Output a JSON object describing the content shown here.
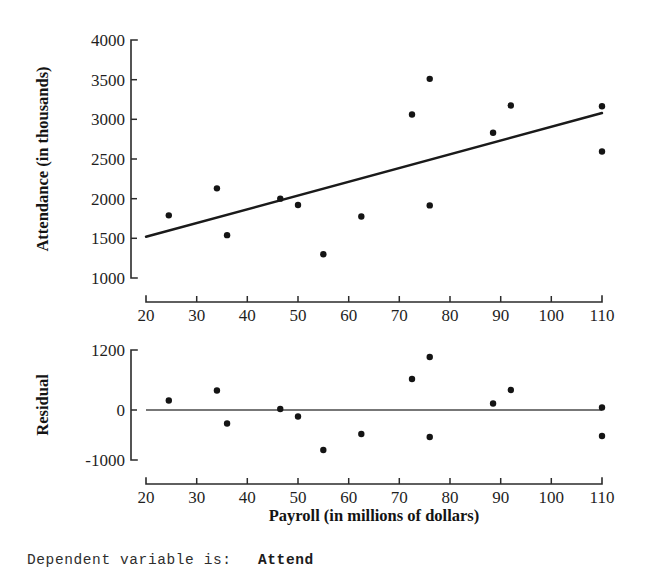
{
  "figure": {
    "regression_output": {
      "label": "Dependent variable is:",
      "value": "Attend"
    }
  },
  "chart_data": [
    {
      "type": "scatter",
      "title": "",
      "xlabel": "Payroll (in millions of dollars)",
      "ylabel": "Attendance (in thousands)",
      "xlim": [
        20,
        110
      ],
      "ylim": [
        1000,
        4000
      ],
      "xticks": [
        20,
        30,
        40,
        50,
        60,
        70,
        80,
        90,
        100,
        110
      ],
      "yticks": [
        1000,
        1500,
        2000,
        2500,
        3000,
        3500,
        4000
      ],
      "xticklabels": [
        "20",
        "30",
        "40",
        "50",
        "60",
        "70",
        "80",
        "90",
        "100",
        "110"
      ],
      "yticklabels": [
        "1000",
        "1500",
        "2000",
        "2500",
        "3000",
        "3500",
        "4000"
      ],
      "grid": false,
      "legend": "none",
      "x": [
        24.5,
        34.0,
        36.0,
        46.5,
        50.0,
        55.0,
        62.5,
        72.5,
        76.0,
        76.0,
        88.5,
        92.0,
        110.0,
        110.0
      ],
      "y": [
        1790,
        2130,
        1540,
        2000,
        1920,
        1300,
        1775,
        3060,
        3510,
        1915,
        2830,
        3175,
        3165,
        2595
      ],
      "trendline": {
        "label": "least-squares regression line",
        "x": [
          20,
          110
        ],
        "y": [
          1520,
          3080
        ]
      }
    },
    {
      "type": "scatter",
      "title": "",
      "xlabel": "Payroll (in millions of dollars)",
      "ylabel": "Residual",
      "xlim": [
        20,
        110
      ],
      "ylim": [
        -1000,
        1200
      ],
      "xticks": [
        20,
        30,
        40,
        50,
        60,
        70,
        80,
        90,
        100,
        110
      ],
      "yticks": [
        -1000,
        0,
        1200
      ],
      "xticklabels": [
        "20",
        "30",
        "40",
        "50",
        "60",
        "70",
        "80",
        "90",
        "100",
        "110"
      ],
      "yticklabels": [
        "-1000",
        "0",
        "1200"
      ],
      "grid": false,
      "legend": "none",
      "x": [
        24.5,
        34.0,
        36.0,
        46.5,
        50.0,
        55.0,
        62.5,
        72.5,
        76.0,
        76.0,
        88.5,
        92.0,
        110.0,
        110.0
      ],
      "y": [
        190,
        390,
        -270,
        20,
        -130,
        -800,
        -480,
        620,
        1060,
        -540,
        130,
        400,
        50,
        -520
      ],
      "reference_line": {
        "label": "zero residual line",
        "value": 0
      }
    }
  ]
}
